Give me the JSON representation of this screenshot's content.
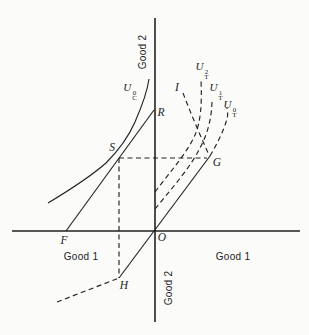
{
  "figure": {
    "width": 309,
    "height": 335,
    "background": "#fbfbfa",
    "ink": "#222222",
    "dash_pattern": "5 3.5"
  },
  "axes": [
    {
      "id": "vertical-axis",
      "x1": 155,
      "y1": 18,
      "x2": 155,
      "y2": 322
    },
    {
      "id": "horizontal-axis",
      "x1": 12,
      "y1": 231,
      "x2": 300,
      "y2": 231
    }
  ],
  "curves": [
    {
      "id": "consumption-indifference-curve-uc0",
      "dashed": false,
      "d": "M 48 203 C 68 191 90 177 106 163 C 117 152 128 138 135 122 C 142 106 147 93 149 79"
    },
    {
      "id": "price-line-F-S-R",
      "dashed": false,
      "d": "M 66 231 L 154 110"
    },
    {
      "id": "price-line-H-O-G",
      "dashed": false,
      "d": "M 119 278 L 210 156"
    },
    {
      "id": "offer-tail-dashed",
      "dashed": true,
      "d": "M 57 302 L 119 278"
    },
    {
      "id": "drop-line-S-H",
      "dashed": true,
      "d": "M 119 158 L 119 278"
    },
    {
      "id": "level-line-S-G",
      "dashed": true,
      "d": "M 119 158 L 207 158"
    },
    {
      "id": "line-I-G",
      "dashed": true,
      "d": "M 183 93 C 191 114 200 135 209 155"
    },
    {
      "id": "trade-indifference-ut0",
      "dashed": true,
      "d": "M 210 156 C 217 144 223 132 226 122 C 228 116 228 113 227 108"
    },
    {
      "id": "trade-indifference-ut1",
      "dashed": true,
      "d": "M 155 209 C 172 188 190 168 200 148 C 208 133 212 117 212 99"
    },
    {
      "id": "trade-indifference-ut2",
      "dashed": true,
      "d": "M 155 192 C 170 172 187 153 195 135 C 201 121 202 103 201 80"
    }
  ],
  "axis_labels": [
    {
      "id": "good2-top",
      "text": "Good 2",
      "x": 143,
      "y": 52,
      "rotate": -90
    },
    {
      "id": "good2-bottom",
      "text": "Good 2",
      "x": 169,
      "y": 288,
      "rotate": -90
    },
    {
      "id": "good1-left",
      "text": "Good 1",
      "x": 81,
      "y": 257,
      "rotate": 0
    },
    {
      "id": "good1-right",
      "text": "Good 1",
      "x": 233,
      "y": 257,
      "rotate": 0
    }
  ],
  "point_labels": [
    {
      "id": "R",
      "text": "R",
      "x": 161,
      "y": 113
    },
    {
      "id": "S",
      "text": "S",
      "x": 112,
      "y": 148
    },
    {
      "id": "G",
      "text": "G",
      "x": 217,
      "y": 163
    },
    {
      "id": "F",
      "text": "F",
      "x": 64,
      "y": 241
    },
    {
      "id": "O",
      "text": "O",
      "x": 162,
      "y": 238
    },
    {
      "id": "H",
      "text": "H",
      "x": 124,
      "y": 286
    },
    {
      "id": "I",
      "text": "I",
      "x": 177,
      "y": 88
    }
  ],
  "math_labels": [
    {
      "id": "uc0",
      "base": "U",
      "sup": "0",
      "sub": "C",
      "x": 130,
      "y": 92
    },
    {
      "id": "ut2",
      "base": "U",
      "sup": "2",
      "sub": "T",
      "x": 202,
      "y": 71
    },
    {
      "id": "ut1",
      "base": "U",
      "sup": "1",
      "sub": "T",
      "x": 216,
      "y": 92
    },
    {
      "id": "ut0",
      "base": "U",
      "sup": "0",
      "sub": "T",
      "x": 230,
      "y": 109
    }
  ]
}
